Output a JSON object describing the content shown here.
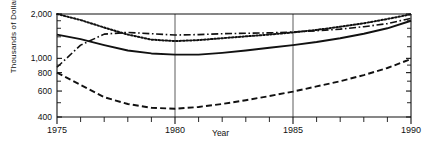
{
  "chart_data": {
    "type": "line",
    "title": "",
    "xlabel": "Year",
    "ylabel": "Thousands of Dollars",
    "yscale": "log",
    "ylim": [
      400,
      2100
    ],
    "xlim": [
      1975,
      1990
    ],
    "grid": "vertical gridlines at 1980 and 1985",
    "legend": "none",
    "y_ticks": [
      400,
      600,
      800,
      1000,
      2000
    ],
    "y_tick_labels": [
      "400",
      "600",
      "800",
      "1,000",
      "2,000"
    ],
    "y_minor_ticks": [
      500,
      700,
      900,
      1200,
      1400,
      1600,
      1800
    ],
    "x_ticks": [
      1975,
      1976,
      1977,
      1978,
      1979,
      1980,
      1981,
      1982,
      1983,
      1984,
      1985,
      1986,
      1987,
      1988,
      1989,
      1990
    ],
    "x_tick_labels": [
      "1975",
      "1980",
      "1985",
      "1990"
    ],
    "x_labeled_ticks": [
      1975,
      1980,
      1985,
      1990
    ],
    "gridline_years": [
      1980,
      1985
    ],
    "x": [
      1975,
      1976,
      1977,
      1978,
      1979,
      1980,
      1981,
      1982,
      1983,
      1984,
      1985,
      1986,
      1987,
      1988,
      1989,
      1990
    ],
    "series": [
      {
        "name": "series-dotted",
        "style": "dotted",
        "values": [
          2000,
          1820,
          1620,
          1450,
          1340,
          1310,
          1330,
          1370,
          1410,
          1450,
          1500,
          1560,
          1640,
          1730,
          1850,
          1990
        ]
      },
      {
        "name": "series-dash-dot",
        "style": "dash-dot",
        "values": [
          870,
          1230,
          1460,
          1500,
          1470,
          1440,
          1450,
          1470,
          1480,
          1490,
          1510,
          1540,
          1580,
          1640,
          1720,
          1870
        ]
      },
      {
        "name": "series-solid",
        "style": "solid",
        "values": [
          1450,
          1350,
          1230,
          1130,
          1080,
          1060,
          1060,
          1090,
          1130,
          1180,
          1230,
          1290,
          1370,
          1470,
          1600,
          1800
        ]
      },
      {
        "name": "series-dashed",
        "style": "dashed",
        "values": [
          800,
          660,
          545,
          490,
          462,
          455,
          468,
          490,
          520,
          555,
          595,
          645,
          700,
          770,
          860,
          990
        ]
      }
    ]
  },
  "axes": {
    "y_title": "Thousands of Dollars",
    "x_title": "Year"
  }
}
